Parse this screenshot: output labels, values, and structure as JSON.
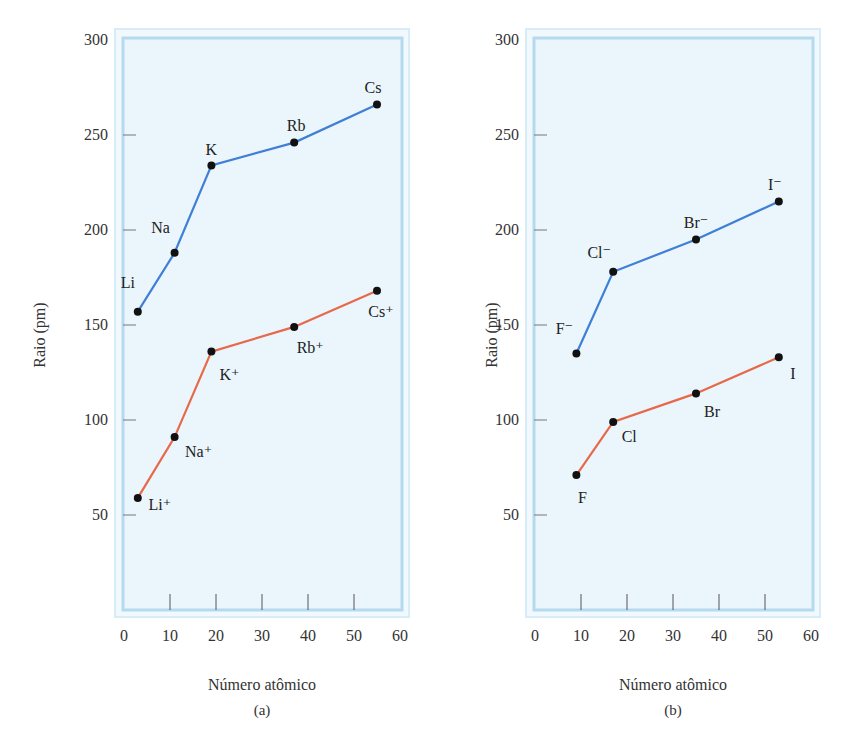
{
  "chart_data": [
    {
      "panel": "a",
      "type": "line",
      "caption": "(a)",
      "xlabel": "Número atômico",
      "ylabel": "Raio (pm)",
      "xlim": [
        0,
        60
      ],
      "ylim": [
        0,
        300
      ],
      "xticks": [
        0,
        10,
        20,
        30,
        40,
        50,
        60
      ],
      "yticks": [
        50,
        100,
        150,
        200,
        250,
        300
      ],
      "grid": false,
      "series": [
        {
          "name": "Átomos metálicos",
          "color": "#3f7fd6",
          "points": [
            {
              "label": "Li",
              "x": 3,
              "y": 157
            },
            {
              "label": "Na",
              "x": 11,
              "y": 188
            },
            {
              "label": "K",
              "x": 19,
              "y": 234
            },
            {
              "label": "Rb",
              "x": 37,
              "y": 246
            },
            {
              "label": "Cs",
              "x": 55,
              "y": 266
            }
          ]
        },
        {
          "name": "Cátions",
          "color": "#e8684a",
          "points": [
            {
              "label": "Li⁺",
              "x": 3,
              "y": 59
            },
            {
              "label": "Na⁺",
              "x": 11,
              "y": 91
            },
            {
              "label": "K⁺",
              "x": 19,
              "y": 136
            },
            {
              "label": "Rb⁺",
              "x": 37,
              "y": 149
            },
            {
              "label": "Cs⁺",
              "x": 55,
              "y": 168
            }
          ]
        }
      ]
    },
    {
      "panel": "b",
      "type": "line",
      "caption": "(b)",
      "xlabel": "Número atômico",
      "ylabel": "Raio (pm)",
      "xlim": [
        0,
        60
      ],
      "ylim": [
        0,
        300
      ],
      "xticks": [
        0,
        10,
        20,
        30,
        40,
        50,
        60
      ],
      "yticks": [
        50,
        100,
        150,
        200,
        250,
        300
      ],
      "grid": false,
      "series": [
        {
          "name": "Ânions",
          "color": "#3f7fd6",
          "points": [
            {
              "label": "F⁻",
              "x": 9,
              "y": 135
            },
            {
              "label": "Cl⁻",
              "x": 17,
              "y": 178
            },
            {
              "label": "Br⁻",
              "x": 35,
              "y": 195
            },
            {
              "label": "I⁻",
              "x": 53,
              "y": 215
            }
          ]
        },
        {
          "name": "Átomos não metálicos",
          "color": "#e8684a",
          "points": [
            {
              "label": "F",
              "x": 9,
              "y": 71
            },
            {
              "label": "Cl",
              "x": 17,
              "y": 99
            },
            {
              "label": "Br",
              "x": 35,
              "y": 114
            },
            {
              "label": "I",
              "x": 53,
              "y": 133
            }
          ]
        }
      ]
    }
  ],
  "colors": {
    "plot_bg": "#eaf5fc",
    "frame_outer": "#d6ecf8",
    "frame_inner": "#b5daf0"
  }
}
